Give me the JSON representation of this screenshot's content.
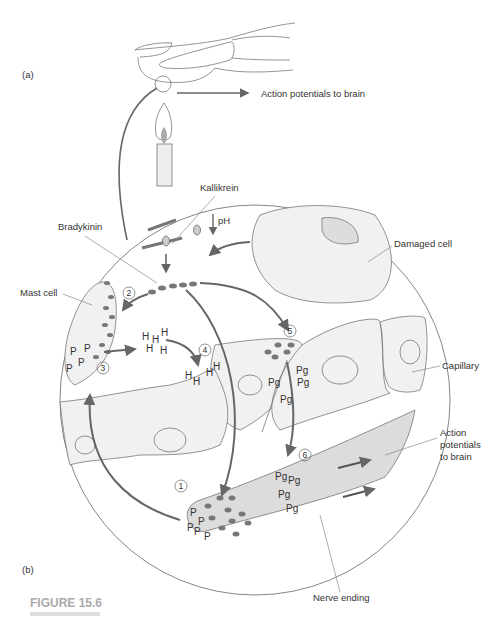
{
  "figure": {
    "title": "FIGURE 15.6",
    "panel_a_label": "(a)",
    "panel_b_label": "(b)"
  },
  "labels": {
    "action_potentials_top": "Action potentials to brain",
    "kallikrein": "Kallikrein",
    "ph": "pH",
    "bradykinin": "Bradykinin",
    "damaged_cell": "Damaged cell",
    "mast_cell": "Mast cell",
    "capillary": "Capillary",
    "action_potentials_1": "Action",
    "action_potentials_2": "potentials",
    "action_potentials_3": "to brain",
    "nerve_ending": "Nerve ending"
  },
  "steps": [
    "1",
    "2",
    "3",
    "4",
    "5",
    "6"
  ],
  "symbols": {
    "P": "P",
    "H": "H",
    "Pg": "Pg"
  },
  "colors": {
    "arrow": "#666666",
    "cell_fill": "#f1f1f1",
    "nerve_fill": "#dcdcdc",
    "dot": "#777777"
  }
}
